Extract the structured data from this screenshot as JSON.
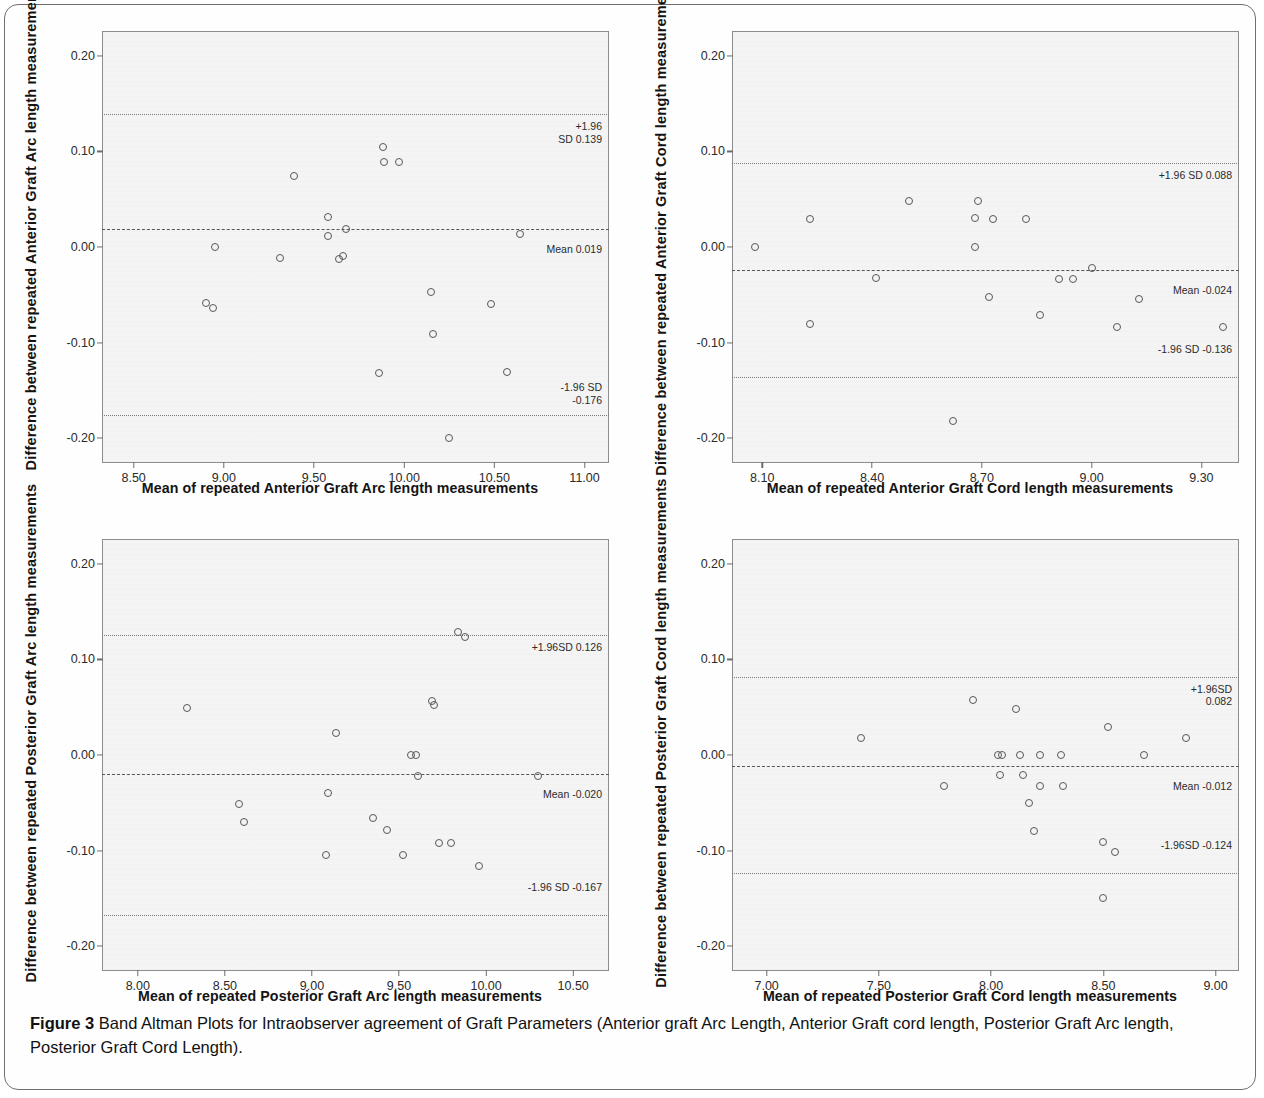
{
  "caption": {
    "label": "Figure 3",
    "text": " Band Altman Plots for Intraobserver agreement of Graft Parameters (Anterior graft Arc Length, Anterior Graft cord length, Posterior Graft Arc length, Posterior Graft Cord Length)."
  },
  "chart_data": [
    {
      "type": "scatter",
      "panel": "top-left",
      "title": "",
      "xlabel": "Mean of repeated Anterior Graft Arc length measurements",
      "ylabel": "Difference between repeated Anterior Graft Arc length measurements",
      "xlim": [
        8.33,
        11.13
      ],
      "ylim": [
        -0.225,
        0.225
      ],
      "xticks": [
        "8.50",
        "9.00",
        "9.50",
        "10.00",
        "10.50",
        "11.00"
      ],
      "xtick_values": [
        8.5,
        9.0,
        9.5,
        10.0,
        10.5,
        11.0
      ],
      "yticks": [
        "0.20",
        "0.10",
        "0.00",
        "-0.10",
        "-0.20"
      ],
      "ytick_values": [
        0.2,
        0.1,
        0.0,
        -0.1,
        -0.2
      ],
      "grid": false,
      "legend": "none",
      "mean": 0.019,
      "upper_loa": 0.139,
      "lower_loa": -0.176,
      "mean_label": "Mean 0.019",
      "upper_label": "+1.96\nSD 0.139",
      "lower_label": "-1.96 SD\n-0.176",
      "points": [
        {
          "x": 8.9,
          "y": -0.059
        },
        {
          "x": 8.94,
          "y": -0.064
        },
        {
          "x": 8.95,
          "y": 0.0
        },
        {
          "x": 9.31,
          "y": -0.012
        },
        {
          "x": 9.39,
          "y": 0.074
        },
        {
          "x": 9.58,
          "y": 0.031
        },
        {
          "x": 9.58,
          "y": 0.011
        },
        {
          "x": 9.64,
          "y": -0.013
        },
        {
          "x": 9.66,
          "y": -0.009
        },
        {
          "x": 9.68,
          "y": 0.019
        },
        {
          "x": 9.86,
          "y": -0.132
        },
        {
          "x": 9.88,
          "y": 0.105
        },
        {
          "x": 9.89,
          "y": 0.089
        },
        {
          "x": 9.97,
          "y": 0.089
        },
        {
          "x": 10.15,
          "y": -0.047
        },
        {
          "x": 10.16,
          "y": -0.091
        },
        {
          "x": 10.25,
          "y": -0.2
        },
        {
          "x": 10.48,
          "y": -0.06
        },
        {
          "x": 10.57,
          "y": -0.131
        },
        {
          "x": 10.64,
          "y": 0.014
        }
      ]
    },
    {
      "type": "scatter",
      "panel": "top-right",
      "title": "",
      "xlabel": "Mean of repeated Anterior Graft Cord length measurements",
      "ylabel": "Difference between repeated Anterior Graft Cord length measurements",
      "xlim": [
        8.02,
        9.4
      ],
      "ylim": [
        -0.225,
        0.225
      ],
      "xticks": [
        "8.10",
        "8.40",
        "8.70",
        "9.00",
        "9.30"
      ],
      "xtick_values": [
        8.1,
        8.4,
        8.7,
        9.0,
        9.3
      ],
      "yticks": [
        "0.20",
        "0.10",
        "0.00",
        "-0.10",
        "-0.20"
      ],
      "ytick_values": [
        0.2,
        0.1,
        0.0,
        -0.1,
        -0.2
      ],
      "grid": false,
      "legend": "none",
      "mean": -0.024,
      "upper_loa": 0.088,
      "lower_loa": -0.136,
      "mean_label": "Mean -0.024",
      "upper_label": "+1.96 SD 0.088",
      "lower_label": "-1.96 SD -0.136",
      "points": [
        {
          "x": 8.08,
          "y": 0.0
        },
        {
          "x": 8.23,
          "y": 0.029
        },
        {
          "x": 8.23,
          "y": -0.081
        },
        {
          "x": 8.41,
          "y": -0.032
        },
        {
          "x": 8.5,
          "y": 0.048
        },
        {
          "x": 8.62,
          "y": -0.182
        },
        {
          "x": 8.68,
          "y": 0.0
        },
        {
          "x": 8.68,
          "y": 0.03
        },
        {
          "x": 8.69,
          "y": 0.048
        },
        {
          "x": 8.72,
          "y": -0.052
        },
        {
          "x": 8.73,
          "y": 0.029
        },
        {
          "x": 8.82,
          "y": 0.029
        },
        {
          "x": 8.86,
          "y": -0.071
        },
        {
          "x": 8.91,
          "y": -0.033
        },
        {
          "x": 8.95,
          "y": -0.033
        },
        {
          "x": 9.0,
          "y": -0.022
        },
        {
          "x": 9.07,
          "y": -0.084
        },
        {
          "x": 9.13,
          "y": -0.054
        },
        {
          "x": 9.36,
          "y": -0.084
        }
      ]
    },
    {
      "type": "scatter",
      "panel": "bottom-left",
      "title": "",
      "xlabel": "Mean of repeated Posterior Graft Arc length measurements",
      "ylabel": "Difference between repeated Posterior Graft Arc length measurements",
      "xlim": [
        7.8,
        10.7
      ],
      "ylim": [
        -0.225,
        0.225
      ],
      "xticks": [
        "8.00",
        "8.50",
        "9.00",
        "9.50",
        "10.00",
        "10.50"
      ],
      "xtick_values": [
        8.0,
        8.5,
        9.0,
        9.5,
        10.0,
        10.5
      ],
      "yticks": [
        "0.20",
        "0.10",
        "0.00",
        "-0.10",
        "-0.20"
      ],
      "ytick_values": [
        0.2,
        0.1,
        0.0,
        -0.1,
        -0.2
      ],
      "grid": false,
      "legend": "none",
      "mean": -0.02,
      "upper_loa": 0.126,
      "lower_loa": -0.167,
      "mean_label": "Mean -0.020",
      "upper_label": "+1.96SD  0.126",
      "lower_label": "-1.96 SD  -0.167",
      "points": [
        {
          "x": 8.28,
          "y": 0.049
        },
        {
          "x": 8.58,
          "y": -0.051
        },
        {
          "x": 8.61,
          "y": -0.07
        },
        {
          "x": 9.08,
          "y": -0.105
        },
        {
          "x": 9.09,
          "y": -0.04
        },
        {
          "x": 9.14,
          "y": 0.023
        },
        {
          "x": 9.35,
          "y": -0.066
        },
        {
          "x": 9.43,
          "y": -0.078
        },
        {
          "x": 9.52,
          "y": -0.105
        },
        {
          "x": 9.57,
          "y": 0.0
        },
        {
          "x": 9.6,
          "y": 0.0
        },
        {
          "x": 9.61,
          "y": -0.022
        },
        {
          "x": 9.69,
          "y": 0.056
        },
        {
          "x": 9.7,
          "y": 0.052
        },
        {
          "x": 9.73,
          "y": -0.092
        },
        {
          "x": 9.8,
          "y": -0.092
        },
        {
          "x": 9.84,
          "y": 0.129
        },
        {
          "x": 9.88,
          "y": 0.124
        },
        {
          "x": 9.96,
          "y": -0.116
        },
        {
          "x": 10.3,
          "y": -0.022
        }
      ]
    },
    {
      "type": "scatter",
      "panel": "bottom-right",
      "title": "",
      "xlabel": "Mean of repeated Posterior Graft Cord length measurements",
      "ylabel": "Difference between repeated Posterior Graft Cord length measurements",
      "xlim": [
        6.85,
        9.1
      ],
      "ylim": [
        -0.225,
        0.225
      ],
      "xticks": [
        "7.00",
        "7.50",
        "8.00",
        "8.50",
        "9.00"
      ],
      "xtick_values": [
        7.0,
        7.5,
        8.0,
        8.5,
        9.0
      ],
      "yticks": [
        "0.20",
        "0.10",
        "0.00",
        "-0.10",
        "-0.20"
      ],
      "ytick_values": [
        0.2,
        0.1,
        0.0,
        -0.1,
        -0.2
      ],
      "grid": false,
      "legend": "none",
      "mean": -0.012,
      "upper_loa": 0.082,
      "lower_loa": -0.124,
      "mean_label": "Mean -0.012",
      "upper_label": "+1.96SD\n0.082",
      "lower_label": "-1.96SD -0.124",
      "points": [
        {
          "x": 7.42,
          "y": 0.018
        },
        {
          "x": 7.79,
          "y": -0.032
        },
        {
          "x": 7.92,
          "y": 0.058
        },
        {
          "x": 8.03,
          "y": 0.0
        },
        {
          "x": 8.05,
          "y": 0.0
        },
        {
          "x": 8.04,
          "y": -0.021
        },
        {
          "x": 8.11,
          "y": 0.048
        },
        {
          "x": 8.13,
          "y": 0.0
        },
        {
          "x": 8.14,
          "y": -0.021
        },
        {
          "x": 8.17,
          "y": -0.05
        },
        {
          "x": 8.19,
          "y": -0.08
        },
        {
          "x": 8.22,
          "y": 0.0
        },
        {
          "x": 8.22,
          "y": -0.032
        },
        {
          "x": 8.31,
          "y": 0.0
        },
        {
          "x": 8.32,
          "y": -0.032
        },
        {
          "x": 8.5,
          "y": -0.15
        },
        {
          "x": 8.5,
          "y": -0.091
        },
        {
          "x": 8.52,
          "y": 0.029
        },
        {
          "x": 8.55,
          "y": -0.102
        },
        {
          "x": 8.68,
          "y": 0.0
        },
        {
          "x": 8.87,
          "y": 0.018
        }
      ]
    }
  ]
}
